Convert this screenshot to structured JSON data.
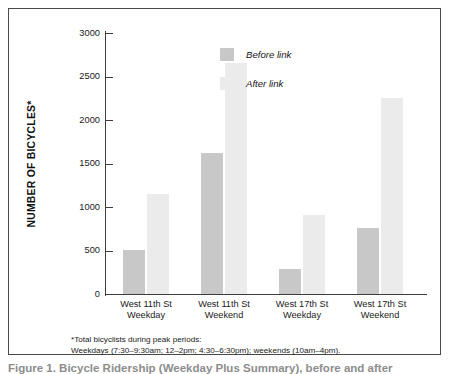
{
  "figure": {
    "caption_partial": "Figure 1. Bicycle Ridership (Weekday Plus Summary), before and after"
  },
  "axis": {
    "y_title": "NUMBER OF BICYCLES*",
    "y_ticks": [
      "0",
      "500",
      "1000",
      "1500",
      "2000",
      "2500",
      "3000"
    ]
  },
  "legend": {
    "items": [
      {
        "label": "Before link",
        "color": "#c8c8c8",
        "key": "before"
      },
      {
        "label": "After link",
        "color": "#ebebeb",
        "key": "after"
      }
    ]
  },
  "footnote": {
    "line1": "*Total bicyclists during peak periods:",
    "line2": "Weekdays (7:30–9:30am; 12–2pm; 4:30–6:30pm); weekends (10am–4pm)."
  },
  "categories": [
    {
      "line1": "West 11th St",
      "line2": "Weekday"
    },
    {
      "line1": "West 11th St",
      "line2": "Weekend"
    },
    {
      "line1": "West 17th St",
      "line2": "Weekday"
    },
    {
      "line1": "West 17th St",
      "line2": "Weekend"
    }
  ],
  "chart_data": {
    "type": "bar",
    "title": "",
    "xlabel": "",
    "ylabel": "NUMBER OF BICYCLES*",
    "ylim": [
      0,
      3000
    ],
    "ytick_interval": 500,
    "grid": false,
    "legend_position": "top-right",
    "categories": [
      "West 11th St Weekday",
      "West 11th St Weekend",
      "West 17th St Weekday",
      "West 17th St Weekend"
    ],
    "series": [
      {
        "name": "Before link",
        "color": "#c8c8c8",
        "values": [
          510,
          1620,
          285,
          760
        ]
      },
      {
        "name": "After link",
        "color": "#ebebeb",
        "values": [
          1150,
          2650,
          910,
          2250
        ]
      }
    ],
    "annotations": [
      "*Total bicyclists during peak periods:",
      "Weekdays (7:30–9:30am; 12–2pm; 4:30–6:30pm); weekends (10am–4pm)."
    ]
  }
}
